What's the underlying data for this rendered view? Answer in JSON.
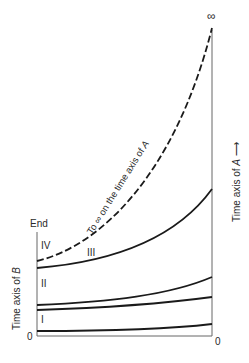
{
  "diagram": {
    "type": "time-axis-comparison",
    "left_axis": {
      "label_prefix": "Time axis of ",
      "label_var": "B",
      "top_label": "End",
      "bottom_label": "0"
    },
    "right_axis": {
      "label_prefix": "Time axis of ",
      "label_var": "A",
      "arrow": "→",
      "top_label": "∞",
      "bottom_label": "0"
    },
    "regions": [
      {
        "id": "I",
        "label": "I"
      },
      {
        "id": "II",
        "label": "II"
      },
      {
        "id": "III",
        "label": "III"
      },
      {
        "id": "IV",
        "label": "IV"
      }
    ],
    "dashed_curve_label": {
      "prefix": "To ",
      "symbol": "∞",
      "middle": " on the time axis of ",
      "var": "A"
    },
    "colors": {
      "line": "#1a1a1a",
      "axis": "#555555",
      "text": "#2a2a2a"
    }
  }
}
